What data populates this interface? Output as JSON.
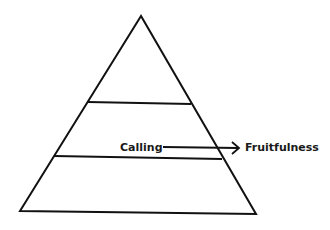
{
  "diagram": {
    "type": "pyramid",
    "levels": 3,
    "stroke_color": "#111111",
    "labels": {
      "from": "Calling",
      "to": "Fruitfulness"
    }
  }
}
